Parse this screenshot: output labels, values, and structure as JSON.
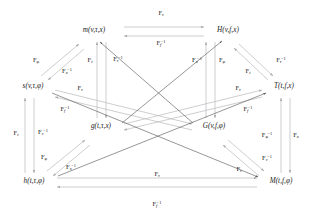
{
  "diagram": {
    "width": 314,
    "height": 217,
    "background_color": "#ffffff",
    "text_color": "#1a1a1a",
    "arrow_color_dark": "#55565a",
    "arrow_color_light": "#b9bbbe",
    "nodes": [
      {
        "id": "m",
        "label": "m(v,τ,x)",
        "x": 94,
        "y": 31
      },
      {
        "id": "H",
        "label": "H(v,f,x)",
        "x": 228,
        "y": 31
      },
      {
        "id": "s",
        "label": "s(v,τ,φ)",
        "x": 33,
        "y": 87
      },
      {
        "id": "T",
        "label": "T(t,f,x)",
        "x": 284,
        "y": 87
      },
      {
        "id": "g",
        "label": "g(t,τ,x)",
        "x": 101,
        "y": 127
      },
      {
        "id": "G",
        "label": "G(v,f,φ)",
        "x": 214,
        "y": 127
      },
      {
        "id": "h",
        "label": "h(t,τ,φ)",
        "x": 34,
        "y": 182
      },
      {
        "id": "M",
        "label": "M(t,f,φ)",
        "x": 281,
        "y": 182
      }
    ],
    "edge_labels": [
      {
        "id": "top-fwd",
        "base": "F",
        "sub": "τ",
        "inv": false,
        "x": 161,
        "y": 14
      },
      {
        "id": "top-inv",
        "base": "F",
        "sub": "f",
        "inv": true,
        "x": 161,
        "y": 44
      },
      {
        "id": "upper-left-phi",
        "base": "F",
        "sub": "φ",
        "inv": false,
        "x": 36,
        "y": 61
      },
      {
        "id": "upper-left-x",
        "base": "F",
        "sub": "x",
        "inv": true,
        "x": 67,
        "y": 72
      },
      {
        "id": "vert-ml-t",
        "base": "F",
        "sub": "t",
        "inv": false,
        "x": 90,
        "y": 61
      },
      {
        "id": "vert-ml-tau",
        "base": "F",
        "sub": "τ",
        "inv": true,
        "x": 118,
        "y": 60
      },
      {
        "id": "vert-mr-x",
        "base": "F",
        "sub": "x",
        "inv": true,
        "x": 197,
        "y": 61
      },
      {
        "id": "vert-mr-phi",
        "base": "F",
        "sub": "φ",
        "inv": false,
        "x": 222,
        "y": 61
      },
      {
        "id": "upper-right-t",
        "base": "F",
        "sub": "t",
        "inv": false,
        "x": 248,
        "y": 72
      },
      {
        "id": "upper-right-tau",
        "base": "F",
        "sub": "τ",
        "inv": true,
        "x": 281,
        "y": 61
      },
      {
        "id": "mid-left-tau",
        "base": "F",
        "sub": "τ",
        "inv": false,
        "x": 80,
        "y": 89
      },
      {
        "id": "mid-left-f",
        "base": "F",
        "sub": "f",
        "inv": true,
        "x": 65,
        "y": 110
      },
      {
        "id": "mid-right-tau",
        "base": "F",
        "sub": "τ",
        "inv": false,
        "x": 238,
        "y": 89
      },
      {
        "id": "mid-right-f",
        "base": "F",
        "sub": "f",
        "inv": true,
        "x": 248,
        "y": 110
      },
      {
        "id": "left-vert-t",
        "base": "F",
        "sub": "t",
        "inv": false,
        "x": 16,
        "y": 134
      },
      {
        "id": "left-vert-v",
        "base": "F",
        "sub": "v",
        "inv": true,
        "x": 43,
        "y": 133
      },
      {
        "id": "lower-left-phi",
        "base": "F",
        "sub": "φ",
        "inv": false,
        "x": 44,
        "y": 158
      },
      {
        "id": "lower-left-x",
        "base": "F",
        "sub": "x",
        "inv": true,
        "x": 71,
        "y": 168
      },
      {
        "id": "right-vert-phi",
        "base": "F",
        "sub": "φ",
        "inv": true,
        "x": 267,
        "y": 136
      },
      {
        "id": "right-vert-x",
        "base": "F",
        "sub": "x",
        "inv": false,
        "x": 296,
        "y": 136
      },
      {
        "id": "lower-right-v",
        "base": "F",
        "sub": "v",
        "inv": true,
        "x": 267,
        "y": 159
      },
      {
        "id": "lower-right-t",
        "base": "F",
        "sub": "t",
        "inv": false,
        "x": 239,
        "y": 170
      },
      {
        "id": "bottom-fwd",
        "base": "F",
        "sub": "τ",
        "inv": false,
        "x": 157,
        "y": 175
      },
      {
        "id": "bottom-inv",
        "base": "F",
        "sub": "f",
        "inv": true,
        "x": 157,
        "y": 205
      }
    ],
    "edges": [
      {
        "id": "m-H",
        "from": "m",
        "to": "H",
        "kind": "double-horizontal",
        "shade": "light",
        "x1": 124,
        "y1": 27,
        "x2": 204,
        "y2": 27,
        "x3": 124,
        "y3": 36,
        "x4": 204,
        "y4": 36
      },
      {
        "id": "h-M",
        "from": "h",
        "to": "M",
        "kind": "double-horizontal",
        "shade": "light",
        "x1": 57,
        "y1": 178,
        "x2": 257,
        "y2": 178,
        "x3": 57,
        "y3": 187,
        "x4": 257,
        "y4": 187
      },
      {
        "id": "s-m",
        "from": "s",
        "to": "m",
        "kind": "double-diagonal",
        "shade": "light",
        "x1": 41,
        "y1": 76,
        "x2": 79,
        "y2": 44,
        "x3": 48,
        "y3": 80,
        "x4": 84,
        "y4": 49
      },
      {
        "id": "H-T",
        "from": "H",
        "to": "T",
        "kind": "double-diagonal",
        "shade": "light",
        "x1": 239,
        "y1": 44,
        "x2": 273,
        "y2": 76,
        "x3": 234,
        "y3": 48,
        "x4": 268,
        "y4": 80
      },
      {
        "id": "h-g",
        "from": "h",
        "to": "g",
        "kind": "double-diagonal",
        "shade": "light",
        "x1": 47,
        "y1": 171,
        "x2": 85,
        "y2": 140,
        "x3": 53,
        "y3": 176,
        "x4": 90,
        "y4": 145
      },
      {
        "id": "G-M",
        "from": "G",
        "to": "M",
        "kind": "double-diagonal",
        "shade": "light",
        "x1": 228,
        "y1": 140,
        "x2": 264,
        "y2": 171,
        "x3": 223,
        "y3": 145,
        "x4": 259,
        "y4": 176
      },
      {
        "id": "g-m",
        "from": "g",
        "to": "m",
        "kind": "vertical",
        "shade": "light",
        "x1": 97,
        "y1": 118,
        "x2": 97,
        "y2": 42
      },
      {
        "id": "m-g2",
        "from": "m",
        "to": "g",
        "kind": "vertical",
        "shade": "light",
        "x1": 106,
        "y1": 42,
        "x2": 106,
        "y2": 118
      },
      {
        "id": "G-H",
        "from": "G",
        "to": "H",
        "kind": "vertical",
        "shade": "light",
        "x1": 206,
        "y1": 118,
        "x2": 206,
        "y2": 42
      },
      {
        "id": "H-G2",
        "from": "H",
        "to": "G",
        "kind": "vertical",
        "shade": "light",
        "x1": 215,
        "y1": 42,
        "x2": 215,
        "y2": 118
      },
      {
        "id": "h-s",
        "from": "h",
        "to": "s",
        "kind": "vertical",
        "shade": "light",
        "x1": 25,
        "y1": 173,
        "x2": 25,
        "y2": 98
      },
      {
        "id": "s-h2",
        "from": "s",
        "to": "h",
        "kind": "vertical",
        "shade": "light",
        "x1": 34,
        "y1": 98,
        "x2": 34,
        "y2": 173
      },
      {
        "id": "M-T",
        "from": "M",
        "to": "T",
        "kind": "vertical",
        "shade": "light",
        "x1": 281,
        "y1": 173,
        "x2": 281,
        "y2": 98
      },
      {
        "id": "T-M2",
        "from": "T",
        "to": "M",
        "kind": "vertical",
        "shade": "light",
        "x1": 290,
        "y1": 98,
        "x2": 290,
        "y2": 173
      },
      {
        "id": "s-G",
        "from": "s",
        "to": "G",
        "kind": "double-cross",
        "shade": "light",
        "x1": 55,
        "y1": 90,
        "x2": 192,
        "y2": 124,
        "x3": 55,
        "y3": 97,
        "x4": 192,
        "y4": 130
      },
      {
        "id": "g-T",
        "from": "g",
        "to": "T",
        "kind": "double-cross",
        "shade": "light",
        "x1": 124,
        "y1": 124,
        "x2": 262,
        "y2": 90,
        "x3": 124,
        "y3": 130,
        "x4": 262,
        "y4": 97
      },
      {
        "id": "s-M",
        "from": "s",
        "to": "M",
        "kind": "single-cross",
        "shade": "dark",
        "x1": 52,
        "y1": 93,
        "x2": 258,
        "y2": 177
      },
      {
        "id": "g-H",
        "from": "g",
        "to": "H",
        "kind": "single-cross",
        "shade": "dark",
        "x1": 122,
        "y1": 123,
        "x2": 222,
        "y2": 41
      },
      {
        "id": "h-T",
        "from": "h",
        "to": "T",
        "kind": "single-cross",
        "shade": "dark",
        "x1": 58,
        "y1": 176,
        "x2": 266,
        "y2": 93
      },
      {
        "id": "G-m",
        "from": "G",
        "to": "m",
        "kind": "single-cross",
        "shade": "dark",
        "x1": 193,
        "y1": 123,
        "x2": 100,
        "y2": 42
      }
    ]
  }
}
